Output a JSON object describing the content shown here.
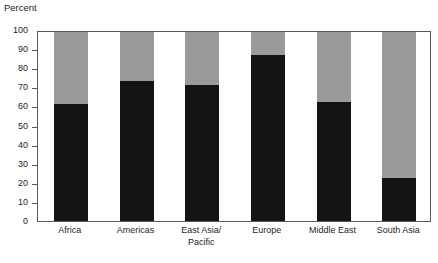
{
  "chart_data": {
    "type": "bar",
    "subtype": "stacked-100",
    "title": "",
    "xlabel": "",
    "ylabel": "Percent",
    "ylim": [
      0,
      100
    ],
    "ytick_step": 10,
    "yticks": [
      0,
      10,
      20,
      30,
      40,
      50,
      60,
      70,
      80,
      90,
      100
    ],
    "ytick_labels": [
      "0",
      "10",
      "20",
      "30",
      "40",
      "50",
      "60",
      "70",
      "80",
      "90",
      "100"
    ],
    "grid": false,
    "legend": "none",
    "categories": [
      "Africa",
      "East Asia/Pacific",
      "Americas",
      "Europe",
      "Middle East",
      "South Asia"
    ],
    "category_display": [
      {
        "line1": "Africa",
        "line2": ""
      },
      {
        "line1": "Americas",
        "line2": ""
      },
      {
        "line1": "East Asia/",
        "line2": "Pacific"
      },
      {
        "line1": "Europe",
        "line2": ""
      },
      {
        "line1": "Middle East",
        "line2": ""
      },
      {
        "line1": "South Asia",
        "line2": ""
      }
    ],
    "series": [
      {
        "name": "lower-segment",
        "color": "#141414",
        "values": [
          62,
          74,
          72,
          88,
          63,
          23
        ]
      },
      {
        "name": "upper-segment",
        "color": "#9a9a9a",
        "values": [
          38,
          26,
          28,
          12,
          37,
          77
        ]
      }
    ]
  },
  "axis": {
    "y_title": "Percent"
  },
  "colors": {
    "lower_segment": "#141414",
    "upper_segment": "#9a9a9a",
    "frame": "#58595b",
    "text": "#1e1e1e",
    "background": "#ffffff"
  }
}
